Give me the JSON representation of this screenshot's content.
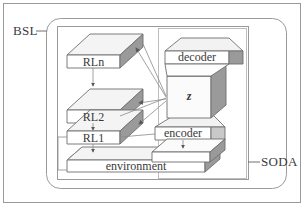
{
  "figure": {
    "outer_frame_label": "BSL",
    "inner_frame_label": "SODA"
  },
  "colors": {
    "background": "#ffffff",
    "stroke": "#6e6e6e",
    "stroke_dark": "#4a4a4a",
    "text": "#3a3a3a",
    "face_top": "#f2f2f2",
    "face_front": "#ffffff",
    "face_side": "#9a9a9a",
    "face_side_light": "#c9c9c9",
    "frame": "#9a9a9a"
  },
  "blocks": [
    {
      "id": "rln",
      "label": "RLn",
      "kind": "slab"
    },
    {
      "id": "rl2",
      "label": "RL2",
      "kind": "slab"
    },
    {
      "id": "rl1",
      "label": "RL1",
      "kind": "slab"
    },
    {
      "id": "environment",
      "label": "environment",
      "kind": "slab-wide"
    },
    {
      "id": "decoder",
      "label": "decoder",
      "kind": "frustum-down"
    },
    {
      "id": "latent",
      "label": "z",
      "kind": "cube",
      "italic": true
    },
    {
      "id": "encoder",
      "label": "encoder",
      "kind": "frustum-up"
    }
  ],
  "connections": [
    {
      "from": "latent",
      "to": "rln",
      "style": "arrow"
    },
    {
      "from": "latent",
      "to": "rl2",
      "style": "arrow"
    },
    {
      "from": "latent",
      "to": "rl1",
      "style": "arrow"
    },
    {
      "from": "rln",
      "to": "rl2",
      "style": "arrow-down"
    },
    {
      "from": "rl2",
      "to": "rl1",
      "style": "arrow-down"
    },
    {
      "from": "rl1",
      "to": "environment",
      "style": "arrow-down"
    },
    {
      "from": "encoder",
      "to": "environment",
      "style": "arrow-down"
    },
    {
      "from": "rl1",
      "to": "encoder",
      "style": "line"
    },
    {
      "from": "rl2",
      "to": "latent",
      "style": "line"
    }
  ]
}
